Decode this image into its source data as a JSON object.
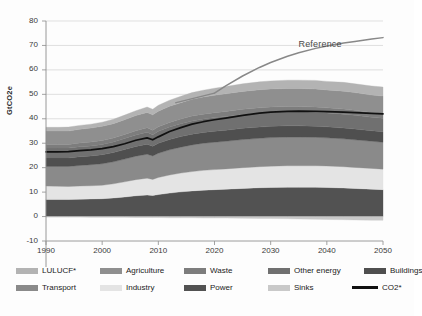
{
  "figure": {
    "reference_annotation": "Reference",
    "caption": ""
  },
  "axes": {
    "y_title": "GtCO2e",
    "y_ticks": [
      80,
      70,
      60,
      50,
      40,
      30,
      20,
      10,
      0,
      -10
    ],
    "x_ticks": [
      1990,
      2000,
      2010,
      2020,
      2030,
      2040,
      2050
    ]
  },
  "legend": {
    "rows": [
      [
        {
          "label": "LULUCF*",
          "color": "#b3b3b3",
          "type": "area"
        },
        {
          "label": "Agriculture",
          "color": "#8f8f8f",
          "type": "area"
        },
        {
          "label": "Waste",
          "color": "#7d7d7d",
          "type": "area"
        },
        {
          "label": "Other energy",
          "color": "#707070",
          "type": "area"
        },
        {
          "label": "Buildings",
          "color": "#4f4f4f",
          "type": "area"
        }
      ],
      [
        {
          "label": "Transport",
          "color": "#8a8a8a",
          "type": "area"
        },
        {
          "label": "Industry",
          "color": "#e4e4e4",
          "type": "area"
        },
        {
          "label": "Power",
          "color": "#525252",
          "type": "area"
        },
        {
          "label": "Sinks",
          "color": "#c9c9c9",
          "type": "area"
        },
        {
          "label": "CO2*",
          "color": "#111111",
          "type": "line"
        }
      ]
    ]
  },
  "chart_data": {
    "type": "area",
    "title": "",
    "subtitle": "",
    "xlabel": "",
    "ylabel": "GtCO2e",
    "xlim": [
      1990,
      2050
    ],
    "ylim": [
      -10,
      80
    ],
    "grid": true,
    "legend_position": "bottom",
    "stacking": "stacked",
    "annotations": [
      {
        "text": "Reference",
        "x": 2041,
        "y": 70
      }
    ],
    "x": [
      1990,
      1992,
      1994,
      1996,
      1998,
      2000,
      2002,
      2004,
      2006,
      2008,
      2009,
      2010,
      2012,
      2014,
      2016,
      2018,
      2020,
      2022,
      2025,
      2028,
      2030,
      2033,
      2035,
      2038,
      2040,
      2043,
      2045,
      2048,
      2050
    ],
    "series": [
      {
        "name": "Power",
        "color": "#525252",
        "values": [
          7.0,
          7.0,
          7.0,
          7.1,
          7.2,
          7.3,
          7.6,
          8.0,
          8.5,
          8.8,
          8.6,
          9.0,
          9.6,
          10.1,
          10.5,
          10.8,
          11.0,
          11.2,
          11.5,
          11.8,
          11.9,
          12.0,
          12.0,
          12.0,
          11.9,
          11.7,
          11.5,
          11.2,
          11.0
        ]
      },
      {
        "name": "Industry",
        "color": "#e4e4e4",
        "values": [
          5.5,
          5.4,
          5.3,
          5.4,
          5.4,
          5.5,
          5.8,
          6.2,
          6.6,
          6.9,
          6.6,
          7.0,
          7.4,
          7.7,
          7.9,
          8.1,
          8.2,
          8.3,
          8.5,
          8.6,
          8.7,
          8.8,
          8.8,
          8.8,
          8.8,
          8.7,
          8.6,
          8.5,
          8.4
        ]
      },
      {
        "name": "Transport",
        "color": "#8a8a8a",
        "values": [
          8.0,
          8.1,
          8.2,
          8.4,
          8.6,
          8.8,
          9.0,
          9.3,
          9.6,
          9.8,
          9.6,
          9.9,
          10.3,
          10.6,
          10.9,
          11.1,
          11.2,
          11.3,
          11.5,
          11.6,
          11.7,
          11.7,
          11.7,
          11.6,
          11.5,
          11.4,
          11.3,
          11.1,
          11.0
        ]
      },
      {
        "name": "Buildings",
        "color": "#4f4f4f",
        "values": [
          3.5,
          3.5,
          3.5,
          3.6,
          3.6,
          3.7,
          3.8,
          3.9,
          4.0,
          4.1,
          4.0,
          4.1,
          4.2,
          4.3,
          4.4,
          4.4,
          4.5,
          4.5,
          4.6,
          4.6,
          4.6,
          4.6,
          4.6,
          4.5,
          4.5,
          4.4,
          4.4,
          4.3,
          4.3
        ]
      },
      {
        "name": "Other energy",
        "color": "#707070",
        "values": [
          4.0,
          4.0,
          4.0,
          4.1,
          4.1,
          4.2,
          4.3,
          4.5,
          4.7,
          4.9,
          4.7,
          4.9,
          5.1,
          5.3,
          5.4,
          5.5,
          5.6,
          5.6,
          5.7,
          5.8,
          5.8,
          5.8,
          5.8,
          5.8,
          5.7,
          5.7,
          5.6,
          5.5,
          5.5
        ]
      },
      {
        "name": "Waste",
        "color": "#7d7d7d",
        "values": [
          1.5,
          1.5,
          1.5,
          1.5,
          1.6,
          1.6,
          1.6,
          1.7,
          1.7,
          1.8,
          1.8,
          1.8,
          1.9,
          1.9,
          2.0,
          2.0,
          2.0,
          2.1,
          2.1,
          2.1,
          2.1,
          2.1,
          2.1,
          2.1,
          2.1,
          2.1,
          2.1,
          2.0,
          2.0
        ]
      },
      {
        "name": "Agriculture",
        "color": "#8f8f8f",
        "values": [
          5.5,
          5.5,
          5.5,
          5.6,
          5.7,
          5.8,
          5.9,
          6.0,
          6.2,
          6.3,
          6.3,
          6.4,
          6.6,
          6.7,
          6.9,
          7.0,
          7.1,
          7.2,
          7.3,
          7.4,
          7.4,
          7.4,
          7.4,
          7.4,
          7.3,
          7.3,
          7.2,
          7.1,
          7.1
        ]
      },
      {
        "name": "LULUCF*",
        "color": "#b3b3b3",
        "values": [
          1.5,
          1.5,
          1.6,
          1.6,
          1.6,
          1.7,
          1.8,
          1.9,
          2.0,
          2.2,
          2.3,
          2.4,
          2.5,
          2.6,
          2.7,
          2.8,
          2.9,
          3.0,
          3.1,
          3.2,
          3.3,
          3.4,
          3.4,
          3.5,
          3.5,
          3.6,
          3.6,
          3.7,
          3.7
        ]
      }
    ],
    "sinks": {
      "name": "Sinks",
      "color": "#c9c9c9",
      "values": [
        -0.2,
        -0.2,
        -0.2,
        -0.2,
        -0.3,
        -0.3,
        -0.3,
        -0.3,
        -0.4,
        -0.4,
        -0.4,
        -0.4,
        -0.5,
        -0.5,
        -0.5,
        -0.6,
        -0.6,
        -0.6,
        -0.7,
        -0.8,
        -0.8,
        -0.9,
        -1.0,
        -1.1,
        -1.2,
        -1.3,
        -1.4,
        -1.5,
        -1.5
      ]
    },
    "lines": [
      {
        "name": "CO2*",
        "color": "#111111",
        "values": [
          26.5,
          26.5,
          26.6,
          27.0,
          27.3,
          27.8,
          28.6,
          29.8,
          31.2,
          32.2,
          31.4,
          32.6,
          34.8,
          36.4,
          37.8,
          38.8,
          39.6,
          40.3,
          41.4,
          42.3,
          42.7,
          43.0,
          43.1,
          43.0,
          42.9,
          42.7,
          42.5,
          42.2,
          42.0
        ]
      },
      {
        "name": "Reference",
        "color": "#888888",
        "values": [
          null,
          null,
          null,
          null,
          null,
          null,
          null,
          null,
          null,
          null,
          null,
          null,
          null,
          null,
          null,
          null,
          50.5,
          53.5,
          57.5,
          61.0,
          63.0,
          65.6,
          67.0,
          68.8,
          69.8,
          71.0,
          71.6,
          72.6,
          73.2
        ]
      }
    ]
  }
}
